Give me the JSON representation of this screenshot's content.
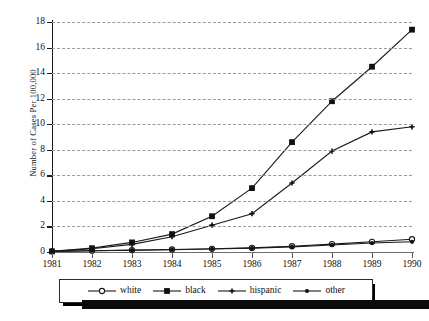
{
  "chart_data": {
    "type": "line",
    "title": "",
    "xlabel": "",
    "ylabel": "Number of Cases Per 100,000",
    "categories": [
      "1981",
      "1982",
      "1983",
      "1984",
      "1985",
      "1986",
      "1987",
      "1988",
      "1989",
      "1990"
    ],
    "x": [
      1981,
      1982,
      1983,
      1984,
      1985,
      1986,
      1987,
      1988,
      1989,
      1990
    ],
    "ylim": [
      0,
      18
    ],
    "xlim": [
      1981,
      1990
    ],
    "yticks": [
      0,
      2,
      4,
      6,
      8,
      10,
      12,
      14,
      16,
      18
    ],
    "grid": "horizontal-dashed",
    "legend_position": "bottom",
    "series": [
      {
        "name": "white",
        "marker": "open-circle",
        "values": [
          0.05,
          0.1,
          0.15,
          0.2,
          0.25,
          0.32,
          0.45,
          0.62,
          0.8,
          1.0
        ]
      },
      {
        "name": "black",
        "marker": "filled-square",
        "values": [
          0.05,
          0.3,
          0.75,
          1.4,
          2.8,
          5.0,
          8.6,
          11.8,
          14.5,
          17.4
        ]
      },
      {
        "name": "hispanic",
        "marker": "small-cross",
        "values": [
          0.05,
          0.25,
          0.6,
          1.2,
          2.1,
          3.0,
          5.4,
          7.9,
          9.4,
          9.8
        ]
      },
      {
        "name": "other",
        "marker": "small-filled",
        "values": [
          0.05,
          0.1,
          0.14,
          0.18,
          0.24,
          0.3,
          0.4,
          0.55,
          0.7,
          0.8
        ]
      }
    ]
  },
  "axis": {
    "y_title": "Number of Cases Per 100,000",
    "y_labels": [
      "0",
      "2",
      "4",
      "6",
      "8",
      "10",
      "12",
      "14",
      "16",
      "18"
    ],
    "x_labels": [
      "1981",
      "1982",
      "1983",
      "1984",
      "1985",
      "1986",
      "1987",
      "1988",
      "1989",
      "1990"
    ]
  },
  "legend": {
    "items": [
      {
        "label": "white"
      },
      {
        "label": "black"
      },
      {
        "label": "hispanic"
      },
      {
        "label": "other"
      }
    ]
  },
  "caption": {
    "text": ""
  },
  "colors": {
    "line": "#1a1a1a",
    "grid": "#9a9a9a",
    "axis": "#1a1a1a"
  }
}
